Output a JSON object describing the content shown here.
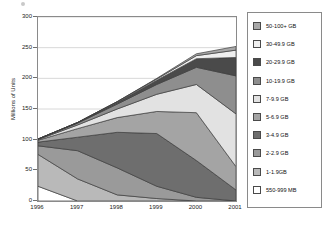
{
  "chart_data": {
    "type": "area",
    "stacked": true,
    "title": "",
    "subtitle": "",
    "xlabel": "",
    "ylabel": "Millions of Units",
    "categories": [
      "1996",
      "1997",
      "1998",
      "1999",
      "2000",
      "2001"
    ],
    "x_tick_labels": [
      "1996",
      "1997",
      "1998",
      "1999",
      "2000",
      "2001"
    ],
    "y_tick_labels": [
      "0",
      "50",
      "100",
      "150",
      "200",
      "250",
      "300"
    ],
    "y_ticks": [
      0,
      50,
      100,
      150,
      200,
      250,
      300
    ],
    "ylim": [
      0,
      300
    ],
    "grid": true,
    "grid_axis": "y",
    "legend_position": "right",
    "stack_order_bottom_to_top": [
      "550-999 MB",
      "1-1.9GB",
      "2-2.9 GB",
      "3-4.9 GB",
      "5-6.9 GB",
      "7-9.9 GB",
      "10-19.9 GB",
      "20-29.9 GB",
      "30-49.9 GB",
      "50-100+ GB"
    ],
    "series": [
      {
        "name": "550-999 MB",
        "color": "#ffffff",
        "values": [
          24,
          0,
          0,
          0,
          0,
          0
        ]
      },
      {
        "name": "1-1.9GB",
        "color": "#b9b9b9",
        "values": [
          52,
          36,
          10,
          4,
          0,
          0
        ]
      },
      {
        "name": "2-2.9 GB",
        "color": "#9a9a9a",
        "values": [
          14,
          46,
          44,
          20,
          6,
          0
        ]
      },
      {
        "name": "3-4.9 GB",
        "color": "#6e6e6e",
        "values": [
          6,
          22,
          58,
          86,
          60,
          18
        ]
      },
      {
        "name": "5-6.9 GB",
        "color": "#a4a4a4",
        "values": [
          3,
          14,
          24,
          36,
          78,
          38
        ]
      },
      {
        "name": "7-9.9 GB",
        "color": "#e2e2e2",
        "values": [
          1,
          6,
          14,
          28,
          46,
          86
        ]
      },
      {
        "name": "10-19.9 GB",
        "color": "#8e8e8e",
        "values": [
          1,
          3,
          8,
          16,
          28,
          62
        ]
      },
      {
        "name": "20-29.9 GB",
        "color": "#4a4a4a",
        "values": [
          0,
          1,
          3,
          7,
          14,
          30
        ]
      },
      {
        "name": "30-49.9 GB",
        "color": "#efefef",
        "values": [
          0,
          0,
          1,
          2,
          5,
          12
        ]
      },
      {
        "name": "50-100+ GB",
        "color": "#a8a8a8",
        "values": [
          0,
          0,
          0,
          1,
          3,
          6
        ]
      }
    ],
    "totals": [
      101,
      128,
      162,
      200,
      240,
      252
    ]
  },
  "y_axis": {
    "title": "Millions of Units",
    "ticks": [
      {
        "label": "300",
        "value": 300
      },
      {
        "label": "250",
        "value": 250
      },
      {
        "label": "200",
        "value": 200
      },
      {
        "label": "150",
        "value": 150
      },
      {
        "label": "100",
        "value": 100
      },
      {
        "label": "50",
        "value": 50
      },
      {
        "label": "0",
        "value": 0
      }
    ]
  },
  "x_axis": {
    "ticks": [
      {
        "label": "1996"
      },
      {
        "label": "1997"
      },
      {
        "label": "1998"
      },
      {
        "label": "1999"
      },
      {
        "label": "2000"
      },
      {
        "label": "2001"
      }
    ]
  },
  "legend": {
    "items": [
      {
        "label": "50-100+ GB",
        "color": "#a8a8a8"
      },
      {
        "label": "30-49.9 GB",
        "color": "#efefef"
      },
      {
        "label": "20-29.9 GB",
        "color": "#4a4a4a"
      },
      {
        "label": "10-19.9 GB",
        "color": "#8e8e8e"
      },
      {
        "label": "7-9.9 GB",
        "color": "#e2e2e2"
      },
      {
        "label": "5-6.9 GB",
        "color": "#a4a4a4"
      },
      {
        "label": "3-4.9 GB",
        "color": "#6e6e6e"
      },
      {
        "label": "2-2.9 GB",
        "color": "#9a9a9a"
      },
      {
        "label": "1-1.9GB",
        "color": "#b9b9b9"
      },
      {
        "label": "550-999 MB",
        "color": "#ffffff"
      }
    ]
  },
  "colors": {
    "frame": "#8a8a8a",
    "grid": "#d8d8d8",
    "series_outline": "#3d3d3d",
    "background": "#ffffff",
    "text": "#1a1a1a"
  }
}
